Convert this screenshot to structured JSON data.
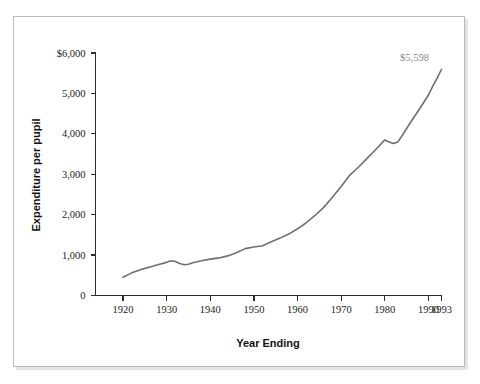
{
  "chart_data": {
    "type": "line",
    "title": "",
    "xlabel": "Year Ending",
    "ylabel": "Expenditure per pupil",
    "xlim": [
      1920,
      1993
    ],
    "ylim": [
      0,
      6000
    ],
    "grid": false,
    "legend": "none",
    "line_color": "#6f6f6f",
    "annotations": [
      {
        "label": "$5,598",
        "x": 1993,
        "y": 5598
      }
    ],
    "y_ticks": [
      0,
      1000,
      2000,
      3000,
      4000,
      5000,
      6000
    ],
    "y_tick_labels": [
      "0",
      "1,000",
      "2,000",
      "3,000",
      "4,000",
      "5,000",
      "$6,000"
    ],
    "x_ticks": [
      1920,
      1930,
      1940,
      1950,
      1960,
      1970,
      1980,
      1990,
      1993
    ],
    "x_tick_labels": [
      "1920",
      "1930",
      "1940",
      "1950",
      "1960",
      "1970",
      "1980",
      "1990",
      "1993"
    ],
    "series": [
      {
        "name": "Expenditure per pupil",
        "x": [
          1920,
          1922,
          1924,
          1926,
          1928,
          1930,
          1931,
          1932,
          1933,
          1934,
          1935,
          1936,
          1938,
          1940,
          1942,
          1944,
          1946,
          1948,
          1950,
          1952,
          1954,
          1956,
          1958,
          1960,
          1962,
          1964,
          1966,
          1968,
          1970,
          1972,
          1974,
          1976,
          1978,
          1980,
          1981,
          1982,
          1983,
          1984,
          1986,
          1988,
          1990,
          1991,
          1992,
          1993
        ],
        "values": [
          450,
          560,
          640,
          700,
          760,
          820,
          860,
          840,
          790,
          760,
          775,
          810,
          860,
          900,
          930,
          980,
          1060,
          1160,
          1200,
          1230,
          1330,
          1420,
          1520,
          1650,
          1800,
          1980,
          2180,
          2430,
          2700,
          2980,
          3180,
          3400,
          3620,
          3850,
          3800,
          3760,
          3800,
          3960,
          4300,
          4620,
          4960,
          5180,
          5380,
          5598
        ]
      }
    ]
  },
  "figure": {
    "y_axis_title": "Expenditure per pupil",
    "x_axis_title": "Year Ending",
    "end_label": "$5,598"
  }
}
